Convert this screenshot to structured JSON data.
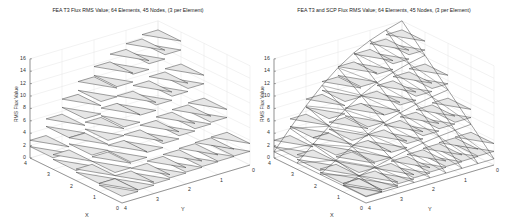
{
  "chart_data": [
    {
      "type": "surface3d",
      "title": "FEA T3 Flux RMS Value; 64 Elements, 45 Nodes, (3 per Element)",
      "xlabel": "X",
      "ylabel": "Y",
      "zlabel": "RMS Flux Value",
      "xlim": [
        0,
        4
      ],
      "ylim": [
        0,
        4
      ],
      "zlim": [
        0,
        16
      ],
      "xticks": [
        "0",
        "1",
        "2",
        "3",
        "4"
      ],
      "yticks": [
        "0",
        "1",
        "2",
        "3",
        "4"
      ],
      "zticks": [
        "0",
        "2",
        "4",
        "6",
        "8",
        "10",
        "12",
        "14",
        "16"
      ],
      "grid": true,
      "style": "discontinuous flat triangles per element",
      "mesh": {
        "elements": 64,
        "nodes": 45,
        "nodes_per_element": 3
      },
      "approx_peak": 16,
      "approx_min": 1
    },
    {
      "type": "surface3d",
      "title": "FEA T3 and SCP Flux RMS Value; 64 Elements, 45 Nodes, (3 per Element)",
      "xlabel": "X",
      "ylabel": "Y",
      "zlabel": "RMS Flux Value",
      "xlim": [
        0,
        4
      ],
      "ylim": [
        0,
        4
      ],
      "zlim": [
        0,
        16
      ],
      "xticks": [
        "0",
        "1",
        "2",
        "3",
        "4"
      ],
      "yticks": [
        "0",
        "1",
        "2",
        "3",
        "4"
      ],
      "zticks": [
        "0",
        "2",
        "4",
        "6",
        "8",
        "10",
        "12",
        "14",
        "16"
      ],
      "grid": true,
      "style": "flat FEA triangles overlaid with continuous SCP wireframe surface",
      "mesh": {
        "elements": 64,
        "nodes": 45,
        "nodes_per_element": 3
      },
      "approx_peak": 16,
      "approx_min": 1
    }
  ],
  "panels": [
    {
      "title": "FEA T3 Flux RMS Value; 64 Elements, 45 Nodes, (3 per Element)",
      "xlabel": "X",
      "ylabel": "Y",
      "zlabel": "RMS Flux Value"
    },
    {
      "title": "FEA T3 and SCP Flux RMS Value; 64 Elements, 45 Nodes, (3 per Element)",
      "xlabel": "X",
      "ylabel": "Y",
      "zlabel": "RMS Flux Value"
    }
  ],
  "ticks": {
    "x": [
      "0",
      "1",
      "2",
      "3",
      "4"
    ],
    "y": [
      "0",
      "1",
      "2",
      "3",
      "4"
    ],
    "z": [
      "0",
      "2",
      "4",
      "6",
      "8",
      "10",
      "12",
      "14",
      "16"
    ]
  },
  "colors": {
    "axis": "#555555",
    "grid": "#e4e4e4",
    "face": "#e6e6e6",
    "edge": "#333333",
    "wire": "#444444"
  }
}
